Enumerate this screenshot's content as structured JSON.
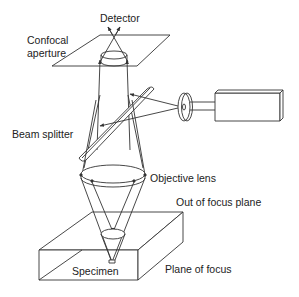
{
  "diagram": {
    "colors": {
      "line": "#333333",
      "text": "#222222",
      "background": "#ffffff"
    },
    "labels": {
      "detector": "Detector",
      "confocal_aperture_line1": "Confocal",
      "confocal_aperture_line2": "aperture",
      "beam_splitter": "Beam splitter",
      "objective_lens": "Objective lens",
      "out_of_focus_plane": "Out of focus plane",
      "specimen": "Specimen",
      "plane_of_focus": "Plane of focus"
    },
    "components": [
      "detector",
      "confocal-aperture",
      "beam-splitter",
      "laser-source",
      "objective-lens",
      "specimen",
      "out-of-focus-plane",
      "plane-of-focus"
    ]
  }
}
